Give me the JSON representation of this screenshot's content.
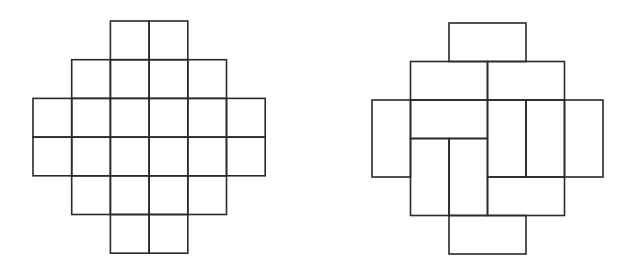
{
  "figure": {
    "left_panel": {
      "name": "aztec-diamond-grid",
      "origin": [
        33,
        21
      ],
      "cell_size": 38.7,
      "rows": [
        {
          "row": 0,
          "start_col": 2,
          "count": 2
        },
        {
          "row": 1,
          "start_col": 1,
          "count": 4
        },
        {
          "row": 2,
          "start_col": 0,
          "count": 6
        },
        {
          "row": 3,
          "start_col": 0,
          "count": 6
        },
        {
          "row": 4,
          "start_col": 1,
          "count": 4
        },
        {
          "row": 5,
          "start_col": 2,
          "count": 2
        }
      ]
    },
    "right_panel": {
      "name": "domino-tiling",
      "origin": [
        372,
        23
      ],
      "cell_size": 38.5,
      "dominoes": [
        {
          "row": 0,
          "col": 2,
          "w": 2,
          "h": 1
        },
        {
          "row": 1,
          "col": 1,
          "w": 2,
          "h": 1
        },
        {
          "row": 1,
          "col": 3,
          "w": 2,
          "h": 1
        },
        {
          "row": 2,
          "col": 0,
          "w": 1,
          "h": 2
        },
        {
          "row": 2,
          "col": 1,
          "w": 2,
          "h": 1
        },
        {
          "row": 2,
          "col": 3,
          "w": 1,
          "h": 2
        },
        {
          "row": 2,
          "col": 4,
          "w": 1,
          "h": 2
        },
        {
          "row": 2,
          "col": 5,
          "w": 1,
          "h": 2
        },
        {
          "row": 3,
          "col": 1,
          "w": 1,
          "h": 2
        },
        {
          "row": 3,
          "col": 2,
          "w": 1,
          "h": 2
        },
        {
          "row": 4,
          "col": 3,
          "w": 2,
          "h": 1
        },
        {
          "row": 5,
          "col": 2,
          "w": 2,
          "h": 1
        }
      ]
    },
    "colors": {
      "stroke": "#2a2a2a",
      "background": "#ffffff"
    }
  }
}
